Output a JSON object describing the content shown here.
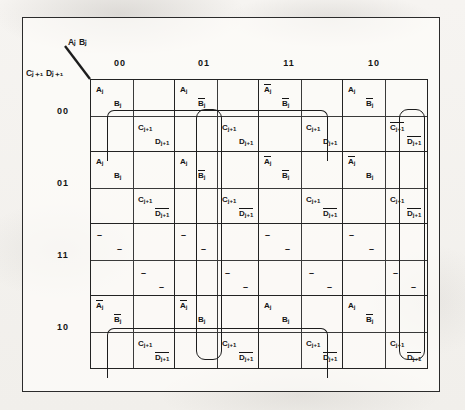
{
  "figure": {
    "type": "karnaugh-map",
    "title": "",
    "axis": {
      "columns_label": "Aⱼ Bⱼ",
      "rows_label": "Cⱼ₊₁ Dⱼ₊₁",
      "column_headers": [
        "00",
        "01",
        "11",
        "10"
      ],
      "row_headers": [
        "00",
        "01",
        "11",
        "10"
      ]
    },
    "variables": {
      "a": "A",
      "b": "B",
      "c": "C",
      "d": "D",
      "sub_j": "j",
      "sub_j1": "j+1"
    }
  },
  "chart_data": {
    "type": "table",
    "xlabel": "AⱼBⱼ",
    "ylabel": "Cⱼ₊₁Dⱼ₊₁",
    "categories": [
      "00",
      "01",
      "11",
      "10"
    ],
    "row_categories": [
      "00",
      "01",
      "11",
      "10"
    ],
    "cells": [
      [
        {
          "q1": "Aj",
          "q2": "Bj",
          "q3": "Cj+1",
          "q4": "Dj+1"
        },
        {
          "q1": "Aj",
          "q2": "Bj_bar",
          "q3": "Cj+1",
          "q4": "Dj+1"
        },
        {
          "q1": "Aj_bar",
          "q2": "Bj_bar",
          "q3": "Cj+1",
          "q4": "Dj+1"
        },
        {
          "q1": "Aj",
          "q2": "Bj_bar",
          "q3": "Cj+1_bar",
          "q4": "Dj+1_bar"
        }
      ],
      [
        {
          "q1": "Aj",
          "q2": "Bj",
          "q3": "Cj+1",
          "q4": "Dj+1_bar"
        },
        {
          "q1": "Aj",
          "q2": "Bj_bar",
          "q3": "Cj+1",
          "q4": "Dj+1_bar"
        },
        {
          "q1": "Aj_bar",
          "q2": "Bj_bar",
          "q3": "Cj+1",
          "q4": "Dj+1_bar"
        },
        {
          "q1": "Aj_bar",
          "q2": "Bj",
          "q3": "Cj+1",
          "q4": "Dj+1_bar"
        }
      ],
      [
        {
          "q1": "-",
          "q2": "-",
          "q3": "-",
          "q4": "-"
        },
        {
          "q1": "-",
          "q2": "-",
          "q3": "-",
          "q4": "-"
        },
        {
          "q1": "-",
          "q2": "-",
          "q3": "-",
          "q4": "-"
        },
        {
          "q1": "-",
          "q2": "-",
          "q3": "-",
          "q4": "-"
        }
      ],
      [
        {
          "q1": "Aj_bar",
          "q2": "Bj_bar",
          "q3": "Cj+1",
          "q4": "Dj+1_bar"
        },
        {
          "q1": "Aj_bar",
          "q2": "Bj",
          "q3": "Cj+1",
          "q4": "Dj+1_bar"
        },
        {
          "q1": "Aj",
          "q2": "Bj",
          "q3": "Cj+1",
          "q4": "Dj+1_bar"
        },
        {
          "q1": "Aj",
          "q2": "Bj_bar",
          "q3": "Cj+1",
          "q4": "Dj+1_bar"
        }
      ]
    ],
    "groupings": [
      {
        "name": "row-00-c",
        "term": "Cj+1",
        "row": 0,
        "cols": [
          0,
          2
        ]
      },
      {
        "name": "row-10-c",
        "term": "Cj+1",
        "row": 3,
        "cols": [
          0,
          2
        ]
      },
      {
        "name": "col-01-c",
        "term": "Cj+1",
        "col": 1,
        "rows": [
          0,
          3
        ]
      },
      {
        "name": "col-10-d",
        "term": "Dj+1_bar",
        "col": 3,
        "rows": [
          0,
          3
        ]
      }
    ],
    "grid": true,
    "legend_position": "none"
  },
  "literals": {
    "Aj": {
      "base": "A",
      "sub": "j",
      "bar": false
    },
    "Aj_bar": {
      "base": "A",
      "sub": "j",
      "bar": true
    },
    "Bj": {
      "base": "B",
      "sub": "j",
      "bar": false
    },
    "Bj_bar": {
      "base": "B",
      "sub": "j",
      "bar": true
    },
    "Cj+1": {
      "base": "C",
      "sub": "j+1",
      "bar": false
    },
    "Cj+1_bar": {
      "base": "C",
      "sub": "j+1",
      "bar": true
    },
    "Dj+1": {
      "base": "D",
      "sub": "j+1",
      "bar": false
    },
    "Dj+1_bar": {
      "base": "D",
      "sub": "j+1",
      "bar": true
    },
    "-": {
      "base": "-",
      "sub": "",
      "bar": false
    }
  },
  "colors": {
    "ink": "#1c1c1c",
    "paper": "#f4f2ef",
    "grid_line": "#232323",
    "loop": "#1d1d1d"
  }
}
